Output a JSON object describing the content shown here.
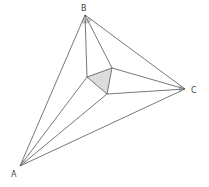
{
  "diagram": {
    "type": "geometry",
    "vertices": {
      "A": {
        "label": "A",
        "x": 20,
        "y": 166,
        "label_x": 11,
        "label_y": 177
      },
      "B": {
        "label": "B",
        "x": 85,
        "y": 15,
        "label_x": 81,
        "label_y": 11
      },
      "C": {
        "label": "C",
        "x": 185,
        "y": 89,
        "label_x": 191,
        "label_y": 93
      }
    },
    "inner_triangle": {
      "P": {
        "x": 87,
        "y": 77
      },
      "Q": {
        "x": 112,
        "y": 68
      },
      "R": {
        "x": 107,
        "y": 94
      },
      "fill": "#dcdcdc"
    },
    "line_color": "#555555"
  }
}
